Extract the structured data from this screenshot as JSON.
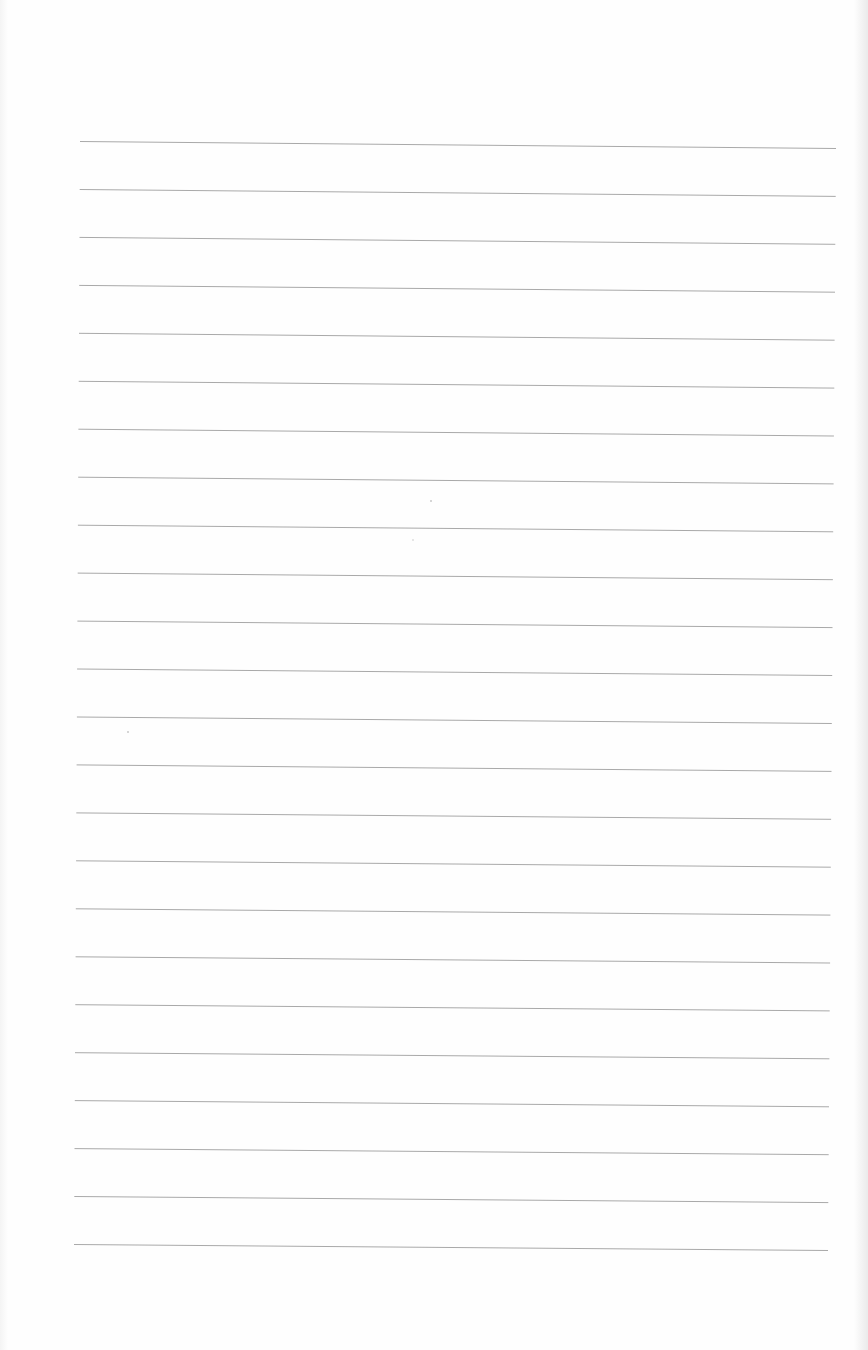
{
  "page": {
    "type": "lined-notebook-page",
    "background_color": "#fefefe",
    "rule_color": "#a9a9a9",
    "rule_count": 24,
    "rule_spacing_px": 48,
    "first_rule": {
      "x1": 80,
      "y1": 141,
      "x2": 836,
      "y2": 148
    },
    "last_rule": {
      "x1": 74,
      "y1": 1244,
      "x2": 828,
      "y2": 1250
    },
    "handwritten_text": []
  }
}
